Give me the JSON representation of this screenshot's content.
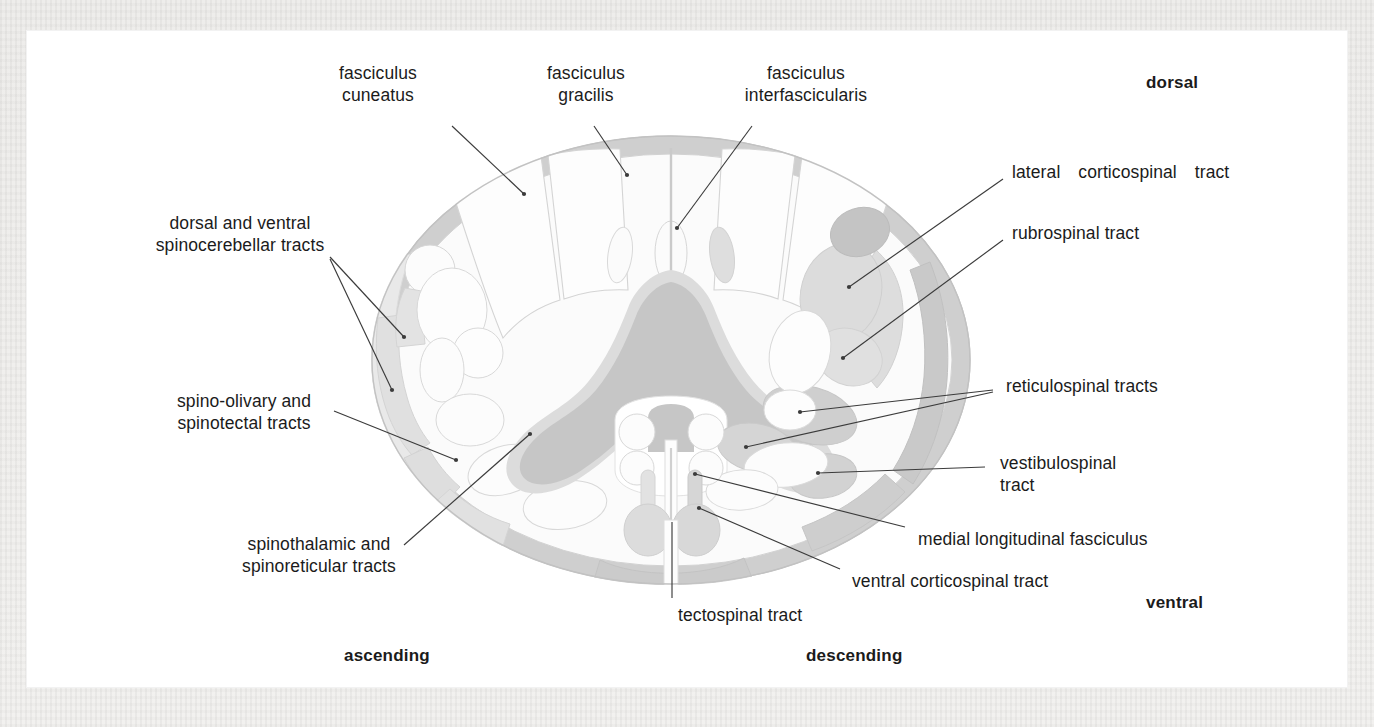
{
  "figure": {
    "kind": "anatomical-cross-section",
    "colors": {
      "page_background": "#efeeec",
      "plate_background": "#ffffff",
      "grey_matter": "#c6c6c6",
      "grey_matter_halo": "#dcdcdc",
      "tract_mid": "#cfcfcf",
      "tract_light": "#e6e6e6",
      "tract_faint": "#f0f0f0",
      "outline": "#c9c9c9",
      "leader_line": "#3b3b3b",
      "text": "#1b1b1b"
    }
  },
  "labels": {
    "fasciculus_cuneatus": "fasciculus\ncuneatus",
    "fasciculus_gracilis": "fasciculus\ngracilis",
    "fasciculus_interfascicularis": "fasciculus\ninterfascicularis",
    "lateral_corticospinal_tract": "lateral  corticospinal  tract",
    "rubrospinal_tract": "rubrospinal tract",
    "reticulospinal_tracts": "reticulospinal tracts",
    "vestibulospinal_tract": "vestibulospinal\ntract",
    "medial_longitudinal_fasciculus": "medial longitudinal fasciculus",
    "ventral_corticospinal_tract": "ventral corticospinal tract",
    "tectospinal_tract": "tectospinal tract",
    "spinothalamic_and_spinoreticular_tracts": "spinothalamic and\nspinoreticular tracts",
    "spino_olivary_and_spinotectal_tracts": "spino-olivary and\nspinotectal tracts",
    "dorsal_and_ventral_spinocerebellar_tracts": "dorsal and ventral\nspinocerebellar tracts"
  },
  "orientation": {
    "dorsal": "dorsal",
    "ventral": "ventral",
    "ascending": "ascending",
    "descending": "descending"
  }
}
